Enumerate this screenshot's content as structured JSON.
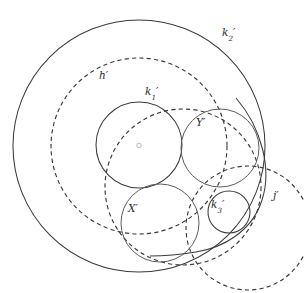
{
  "figure": {
    "width": 304,
    "height": 293,
    "background": "#ffffff",
    "stroke_color": "#3a3a3a",
    "center_mark_color": "#b9a9ae"
  },
  "labels": {
    "k2": {
      "base": "k",
      "sub": "2",
      "prime": "′",
      "x": 222,
      "y": 27
    },
    "h": {
      "base": "h",
      "sub": "",
      "prime": "′",
      "x": 99,
      "y": 70
    },
    "k1": {
      "base": "k",
      "sub": "1",
      "prime": "′",
      "x": 145,
      "y": 86
    },
    "Y": {
      "base": "Y",
      "sub": "",
      "prime": "′",
      "x": 196,
      "y": 117
    },
    "X": {
      "base": "X",
      "sub": "",
      "prime": "′",
      "x": 128,
      "y": 203
    },
    "k3": {
      "base": "k",
      "sub": "3",
      "prime": "′",
      "x": 211,
      "y": 199
    },
    "j": {
      "base": "j",
      "sub": "",
      "prime": "′",
      "x": 273,
      "y": 190
    }
  },
  "chart_data": {
    "type": "diagram",
    "subtype": "euclidean-circle-figure",
    "xlim": [
      0,
      304
    ],
    "ylim": [
      0,
      293
    ],
    "grid": false,
    "legend": null,
    "center_point": {
      "x": 139,
      "y": 145.5,
      "label": "o",
      "style": "small open circle"
    },
    "circles": [
      {
        "name": "k2'",
        "label": "k₂′",
        "cx": 139,
        "cy": 146,
        "r": 126,
        "style": "solid",
        "role": "outer bounding circle"
      },
      {
        "name": "h'",
        "label": "h′",
        "cx": 139,
        "cy": 146,
        "r": 88,
        "style": "dashed",
        "role": "concentric dashed circle"
      },
      {
        "name": "k1'",
        "label": "k₁′",
        "cx": 139,
        "cy": 145,
        "r": 43,
        "style": "solid",
        "role": "inner concentric circle"
      },
      {
        "name": "Y'",
        "label": "Y′",
        "cx": 220,
        "cy": 148,
        "r": 39,
        "style": "solid",
        "role": "upper right tangent circle"
      },
      {
        "name": "X'",
        "label": "X′",
        "cx": 160,
        "cy": 223,
        "r": 39,
        "style": "solid",
        "role": "lower left tangent circle"
      },
      {
        "name": "k3'",
        "label": "k₃′",
        "cx": 229,
        "cy": 212,
        "r": 21,
        "style": "solid",
        "role": "small tangent circle"
      },
      {
        "name": "j'",
        "label": "j′",
        "cx": 248,
        "cy": 228,
        "r": 62,
        "style": "dashed",
        "role": "right dashed circle"
      },
      {
        "name": "dashed-mid",
        "label": "",
        "cx": 183,
        "cy": 187,
        "r": 78,
        "style": "dashed",
        "role": "large dashed circle through center region"
      }
    ],
    "arcs": [
      {
        "name": "right-solid-arc",
        "style": "solid",
        "description": "large solid arc sweeping from upper right down to bottom, tangent near k3'",
        "cx": 150,
        "cy": 150,
        "r": 122,
        "start_angle_deg": -40,
        "end_angle_deg": 80
      }
    ]
  }
}
